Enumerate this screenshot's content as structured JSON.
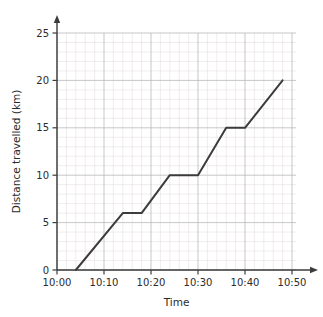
{
  "chart_data": {
    "type": "line",
    "title": "",
    "xlabel": "Time",
    "ylabel": "Distance travelled (km)",
    "x_tick_labels": [
      "10:00",
      "10:10",
      "10:20",
      "10:30",
      "10:40",
      "10:50"
    ],
    "x_tick_minutes": [
      0,
      10,
      20,
      30,
      40,
      50
    ],
    "y_tick_labels": [
      "0",
      "5",
      "10",
      "15",
      "20",
      "25"
    ],
    "y_tick_values": [
      0,
      5,
      10,
      15,
      20,
      25
    ],
    "xlim_minutes": [
      0,
      50
    ],
    "ylim": [
      0,
      26
    ],
    "grid": "on",
    "grid_major_step_x_minutes": 10,
    "grid_major_step_y": 5,
    "grid_minor_step_x_minutes": 2,
    "grid_minor_step_y": 1,
    "legend": "none",
    "series": [
      {
        "name": "Journey",
        "points": [
          {
            "time": "10:04",
            "minutes": 4,
            "distance": 0
          },
          {
            "time": "10:14",
            "minutes": 14,
            "distance": 6
          },
          {
            "time": "10:18",
            "minutes": 18,
            "distance": 6
          },
          {
            "time": "10:24",
            "minutes": 24,
            "distance": 10
          },
          {
            "time": "10:30",
            "minutes": 30,
            "distance": 10
          },
          {
            "time": "10:36",
            "minutes": 36,
            "distance": 15
          },
          {
            "time": "10:40",
            "minutes": 40,
            "distance": 15
          },
          {
            "time": "10:48",
            "minutes": 48,
            "distance": 20
          }
        ]
      }
    ],
    "colors": {
      "line": "#3c3c3c",
      "axis": "#3c3c3c",
      "grid_major": "#b9b9bd",
      "grid_minor": "#e6dcdc",
      "text": "#2b2b2b",
      "background": "#ffffff"
    }
  }
}
